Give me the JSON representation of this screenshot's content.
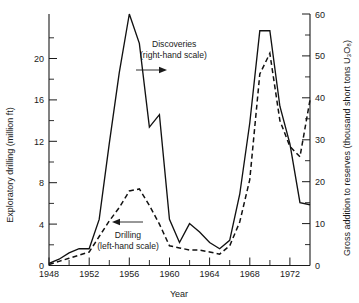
{
  "chart_data": {
    "type": "line",
    "title": "",
    "xlabel": "Year",
    "ylabel": "Exploratory drilling (million ft)",
    "y2label": "Gross addition to reserves (thousand short tons U₃O₈)",
    "xlim": [
      1948,
      1974
    ],
    "ylim": [
      0,
      22
    ],
    "y2lim": [
      0,
      60
    ],
    "grid": false,
    "legend_position": "inline-annotations",
    "x_ticks_major": [
      1948,
      1952,
      1956,
      1960,
      1964,
      1968,
      1972
    ],
    "x_ticks_minor": [
      1950,
      1954,
      1958,
      1962,
      1966,
      1970,
      1974
    ],
    "x_ticklabels": [
      "1948",
      "1952",
      "1956",
      "1960",
      "1964",
      "1968",
      "1972"
    ],
    "y_ticks_major": [
      0,
      4,
      8,
      12,
      16,
      20
    ],
    "y_ticks_minor": [
      2,
      6,
      10,
      14,
      18
    ],
    "y_ticklabels": [
      "0",
      "4",
      "8",
      "12",
      "16",
      "20"
    ],
    "y2_ticks_major": [
      0,
      10,
      20,
      30,
      40,
      50,
      60
    ],
    "y2_ticks_minor": [
      5,
      15,
      25,
      35,
      45,
      55
    ],
    "y2_ticklabels": [
      "0",
      "10",
      "20",
      "30",
      "40",
      "50",
      "60"
    ],
    "x": [
      1948,
      1949,
      1950,
      1951,
      1952,
      1953,
      1954,
      1955,
      1956,
      1957,
      1958,
      1959,
      1960,
      1961,
      1962,
      1963,
      1964,
      1965,
      1966,
      1967,
      1968,
      1969,
      1970,
      1971,
      1972,
      1973,
      1974
    ],
    "series": [
      {
        "name": "Discoveries (right-hand scale)",
        "axis": "right",
        "style": "solid",
        "units": "thousand short tons U3O8",
        "values": [
          0.5,
          1.5,
          3.0,
          4.0,
          4.0,
          11.0,
          29.0,
          46.0,
          60.0,
          53.0,
          33.0,
          36.0,
          11.0,
          5.5,
          10.0,
          8.0,
          5.5,
          4.0,
          6.0,
          17.0,
          34.0,
          56.0,
          56.0,
          38.0,
          29.0,
          15.0,
          14.5
        ]
      },
      {
        "name": "Drilling (left-hand scale)",
        "axis": "left",
        "style": "dashed",
        "units": "million ft",
        "values": [
          0.1,
          0.4,
          0.7,
          1.0,
          1.3,
          2.8,
          4.3,
          5.6,
          7.2,
          7.4,
          5.8,
          4.0,
          1.9,
          1.7,
          1.5,
          1.5,
          1.3,
          1.1,
          1.9,
          4.2,
          8.3,
          18.5,
          20.5,
          14.0,
          11.5,
          10.5,
          16.0
        ]
      }
    ],
    "annotations": [
      {
        "id": "discoveries-annotation",
        "line1": "Discoveries",
        "line2": "(right-hand scale)",
        "arrow": "right"
      },
      {
        "id": "drilling-annotation",
        "line1": "Drilling",
        "line2": "(left-hand scale)",
        "arrow": "left"
      }
    ],
    "colors": {
      "foreground": "#1a1a1a",
      "series": "#111111",
      "background": "#ffffff"
    }
  }
}
